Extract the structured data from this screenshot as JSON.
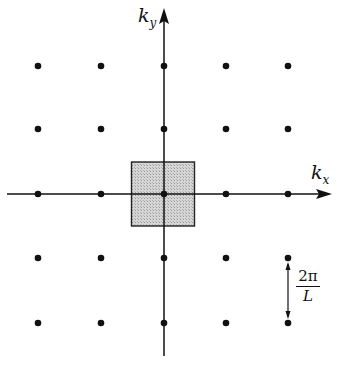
{
  "diagram": {
    "type": "reciprocal-lattice",
    "axes": {
      "x_label": "k",
      "x_subscript": "x",
      "y_label": "k",
      "y_subscript": "y"
    },
    "lattice": {
      "columns": 5,
      "rows": 5,
      "x_positions_px": [
        38,
        101,
        164,
        226,
        288
      ],
      "y_positions_px": [
        66,
        129,
        194,
        258,
        323
      ],
      "origin_px": [
        164,
        194
      ]
    },
    "unit_cell": {
      "shaded": true,
      "fill_color": "#c8c8c8",
      "stroke_color": "#222222"
    },
    "spacing_marker": {
      "numerator": "2π",
      "denominator": "L"
    },
    "colors": {
      "ink": "#111111",
      "background": "#ffffff"
    }
  }
}
